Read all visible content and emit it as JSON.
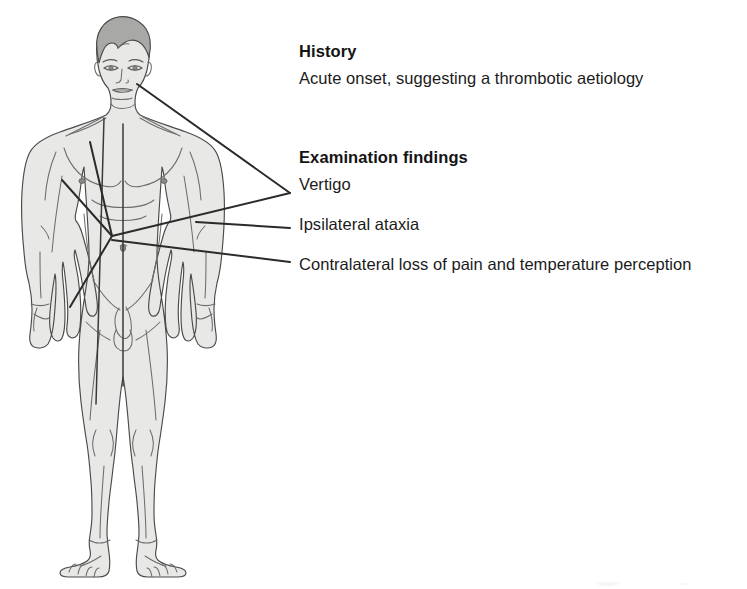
{
  "page": {
    "background_color": "#ffffff",
    "width": 747,
    "height": 589
  },
  "figure": {
    "name": "anterior-male-body-diagram",
    "colors": {
      "skin_fill": "#e8e8e6",
      "skin_shadow": "#dcdcda",
      "hair_fill": "#a8a8a6",
      "outline": "#4a4a4a",
      "detail_line": "#6d6d6d",
      "leader_line": "#2b2b2b"
    }
  },
  "annotations": {
    "leader_lines": [
      {
        "name": "mouth-to-vertigo",
        "from_label": "mouth",
        "to_label": "Vertigo"
      },
      {
        "name": "hub-to-vertigo",
        "from_label": "abdomen-hub",
        "to_label": "Vertigo"
      },
      {
        "name": "arm-to-ipsilateral-ataxia",
        "from_label": "left-arm",
        "to_label": "Ipsilateral ataxia"
      },
      {
        "name": "hub-to-contralateral-loss",
        "from_label": "abdomen-hub",
        "to_label": "Contralateral loss of pain and temperature perception"
      }
    ],
    "body_markers": [
      {
        "name": "abdomen-hub",
        "x": 112,
        "y": 236
      },
      {
        "name": "midline-axis",
        "description": "vertical line down torso midline"
      },
      {
        "name": "right-leg-axis",
        "description": "long line down the figure's right leg"
      }
    ]
  },
  "content": {
    "history": {
      "heading": "History",
      "line": "Acute onset, suggesting a thrombotic aetiology"
    },
    "examination": {
      "heading": "Examination findings",
      "findings": [
        "Vertigo",
        "Ipsilateral ataxia",
        "Contralateral loss of pain and temperature perception"
      ]
    }
  }
}
